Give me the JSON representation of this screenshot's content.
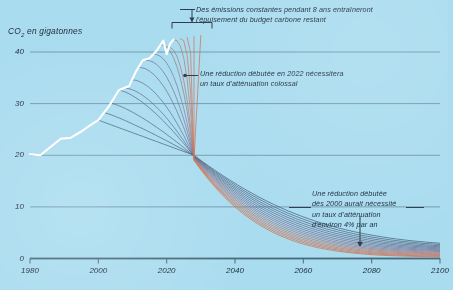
{
  "chart_data": {
    "type": "line",
    "title": "",
    "xlabel": "",
    "ylabel": "CO2 en gigatonnes",
    "ylabel_base": "CO",
    "ylabel_sub": "2",
    "ylabel_rest": " en gigatonnes",
    "xlim": [
      1980,
      2100
    ],
    "ylim": [
      0,
      44
    ],
    "xticks": [
      "1980",
      "2000",
      "2020",
      "2040",
      "2060",
      "2080",
      "2100"
    ],
    "xtick_values": [
      1980,
      2000,
      2020,
      2040,
      2060,
      2080,
      2100
    ],
    "yticks": [
      "0",
      "10",
      "20",
      "30",
      "40"
    ],
    "ytick_values": [
      0,
      10,
      20,
      30,
      40
    ],
    "grid": "horizontal",
    "legend": "none",
    "background_color": "#a9dcef",
    "gridline_color": "#5e7f93",
    "axis_color": "#4a6878",
    "historical_color": "#ffffff",
    "series": [
      {
        "name": "Emissions historiques observees",
        "color": "#ffffff",
        "x": [
          1980,
          1983,
          1986,
          1989,
          1992,
          1995,
          1998,
          2000,
          2003,
          2006,
          2009,
          2011,
          2013,
          2015,
          2017,
          2019,
          2020,
          2021,
          2022
        ],
        "values": [
          20.2,
          20.0,
          21.6,
          23.2,
          23.4,
          24.6,
          26.0,
          26.8,
          29.4,
          32.6,
          33.4,
          36.2,
          38.4,
          38.8,
          40.2,
          42.2,
          39.6,
          41.6,
          42.4
        ]
      },
      {
        "name": "Trajectoire de reduction demarrant en 2000",
        "start_year": 2000,
        "color": "#3d4f6e",
        "peak_value": 26.8,
        "annual_rate_percent": 4
      },
      {
        "name": "Trajectoire de reduction demarrant en 2002",
        "start_year": 2002,
        "color": "#46547180",
        "peak_value": 28.2
      },
      {
        "name": "Trajectoire de reduction demarrant en 2004",
        "start_year": 2004,
        "color": "#4d5877",
        "peak_value": 30.0
      },
      {
        "name": "Trajectoire de reduction demarrant en 2006",
        "start_year": 2006,
        "color": "#545b7b",
        "peak_value": 32.6
      },
      {
        "name": "Trajectoire de reduction demarrant en 2008",
        "start_year": 2008,
        "color": "#5c5f80",
        "peak_value": 33.0
      },
      {
        "name": "Trajectoire de reduction demarrant en 2010",
        "start_year": 2010,
        "color": "#656284",
        "peak_value": 34.6
      },
      {
        "name": "Trajectoire de reduction demarrant en 2012",
        "start_year": 2012,
        "color": "#6f6689",
        "peak_value": 37.0
      },
      {
        "name": "Trajectoire de reduction demarrant en 2014",
        "start_year": 2014,
        "color": "#7a6a8c",
        "peak_value": 38.4
      },
      {
        "name": "Trajectoire de reduction demarrant en 2016",
        "start_year": 2016,
        "color": "#886e8b",
        "peak_value": 39.6
      },
      {
        "name": "Trajectoire de reduction demarrant en 2018",
        "start_year": 2018,
        "color": "#97727f",
        "peak_value": 41.4
      },
      {
        "name": "Trajectoire de reduction demarrant en 2020",
        "start_year": 2020,
        "color": "#a87370",
        "peak_value": 41.0
      },
      {
        "name": "Trajectoire de reduction demarrant en 2022",
        "start_year": 2022,
        "color": "#b87263",
        "peak_value": 42.4
      },
      {
        "name": "Trajectoire de reduction demarrant en 2024",
        "start_year": 2024,
        "color": "#c4705a",
        "peak_value": 42.6
      },
      {
        "name": "Trajectoire de reduction demarrant en 2026",
        "start_year": 2026,
        "color": "#cc6d53",
        "peak_value": 42.8
      },
      {
        "name": "Trajectoire de reduction demarrant en 2028",
        "start_year": 2028,
        "color": "#d06a4e",
        "peak_value": 43.0
      },
      {
        "name": "Trajectoire de reduction demarrant en 2030",
        "start_year": 2030,
        "color": "#d2673f",
        "peak_value": 43.2
      }
    ],
    "annotations": [
      {
        "id": "annotation-carbon-budget",
        "text": "Des émissions constantes pendant 8 ans entraîneront\nl'épuisement du budget carbone restant",
        "marker": "bracket-with-arrow",
        "bracket_span_years": [
          2022,
          2030
        ]
      },
      {
        "id": "annotation-2022-start",
        "text": "Une réduction débutée en 2022 nécessitera\nun taux d'atténuation colossal",
        "marker": "dot-with-leader"
      },
      {
        "id": "annotation-2000-start",
        "text": "Une réduction débutée\ndès 2000 aurait nécessité\nun taux d'atténuation\nd'environ 4% par an",
        "marker": "down-arrow"
      }
    ]
  }
}
